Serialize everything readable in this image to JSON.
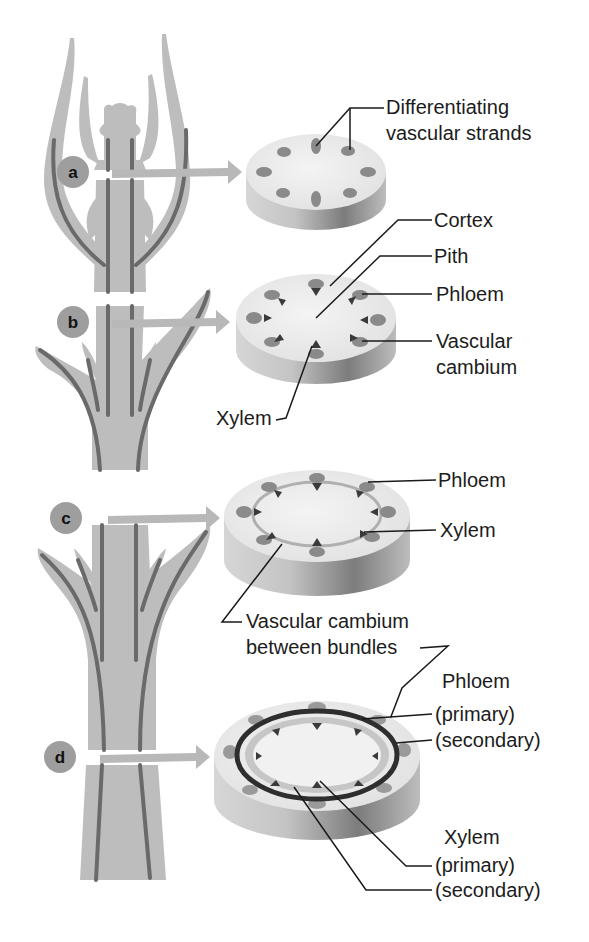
{
  "figure": {
    "stages": [
      {
        "id": "a",
        "letter": "a",
        "labels": [
          "Differentiating",
          "vascular strands"
        ]
      },
      {
        "id": "b",
        "letter": "b",
        "labels": {
          "cortex": "Cortex",
          "pith": "Pith",
          "phloem": "Phloem",
          "cambium_1": "Vascular",
          "cambium_2": "cambium",
          "xylem": "Xylem"
        }
      },
      {
        "id": "c",
        "letter": "c",
        "labels": {
          "phloem": "Phloem",
          "xylem": "Xylem",
          "between_1": "Vascular cambium",
          "between_2": "between bundles"
        }
      },
      {
        "id": "d",
        "letter": "d",
        "labels": {
          "phloem": "Phloem",
          "phloem_primary": "(primary)",
          "phloem_secondary": "(secondary)",
          "xylem": "Xylem",
          "xylem_primary": "(primary)",
          "xylem_secondary": "(secondary)"
        }
      }
    ]
  },
  "colors": {
    "plant_tissue": "#bdbdbd",
    "vascular_strand": "#6a6a6a",
    "disc_top": "#ececec",
    "phloem": "#8a8a8a",
    "xylem": "#3a3a3a",
    "badge": "#9e9e9e"
  }
}
